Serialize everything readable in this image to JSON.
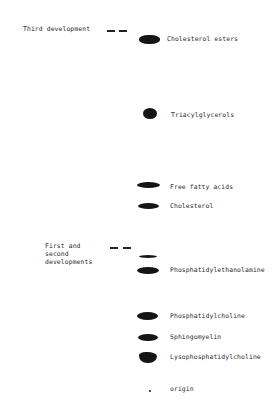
{
  "figure": {
    "type": "thin-layer chromatogram",
    "front_labels": {
      "third": "Third development",
      "first_second": "First and\nsecond\ndevelopments"
    },
    "spots": [
      {
        "name": "Cholesterol esters"
      },
      {
        "name": "Triacylglycerols"
      },
      {
        "name": "Free fatty acids"
      },
      {
        "name": "Cholesterol"
      },
      {
        "name": "Phosphatidylethanolamine"
      },
      {
        "name": "Phosphatidylcholine"
      },
      {
        "name": "Sphingomyelin"
      },
      {
        "name": "Lysophosphatidylcholine"
      },
      {
        "name": "origin"
      }
    ]
  }
}
